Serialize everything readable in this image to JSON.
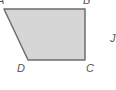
{
  "figure": {
    "shape": "trapezoid",
    "fill_color": "#d6d6d6",
    "stroke_color": "#6e6e6e",
    "vertices": {
      "A": {
        "label": "A",
        "x": 4,
        "y": 9
      },
      "B": {
        "label": "B",
        "x": 85,
        "y": 9
      },
      "C": {
        "label": "C",
        "x": 85,
        "y": 60
      },
      "D": {
        "label": "D",
        "x": 28,
        "y": 60
      }
    },
    "extra_label": {
      "label": "J",
      "x": 110,
      "y": 42
    }
  }
}
